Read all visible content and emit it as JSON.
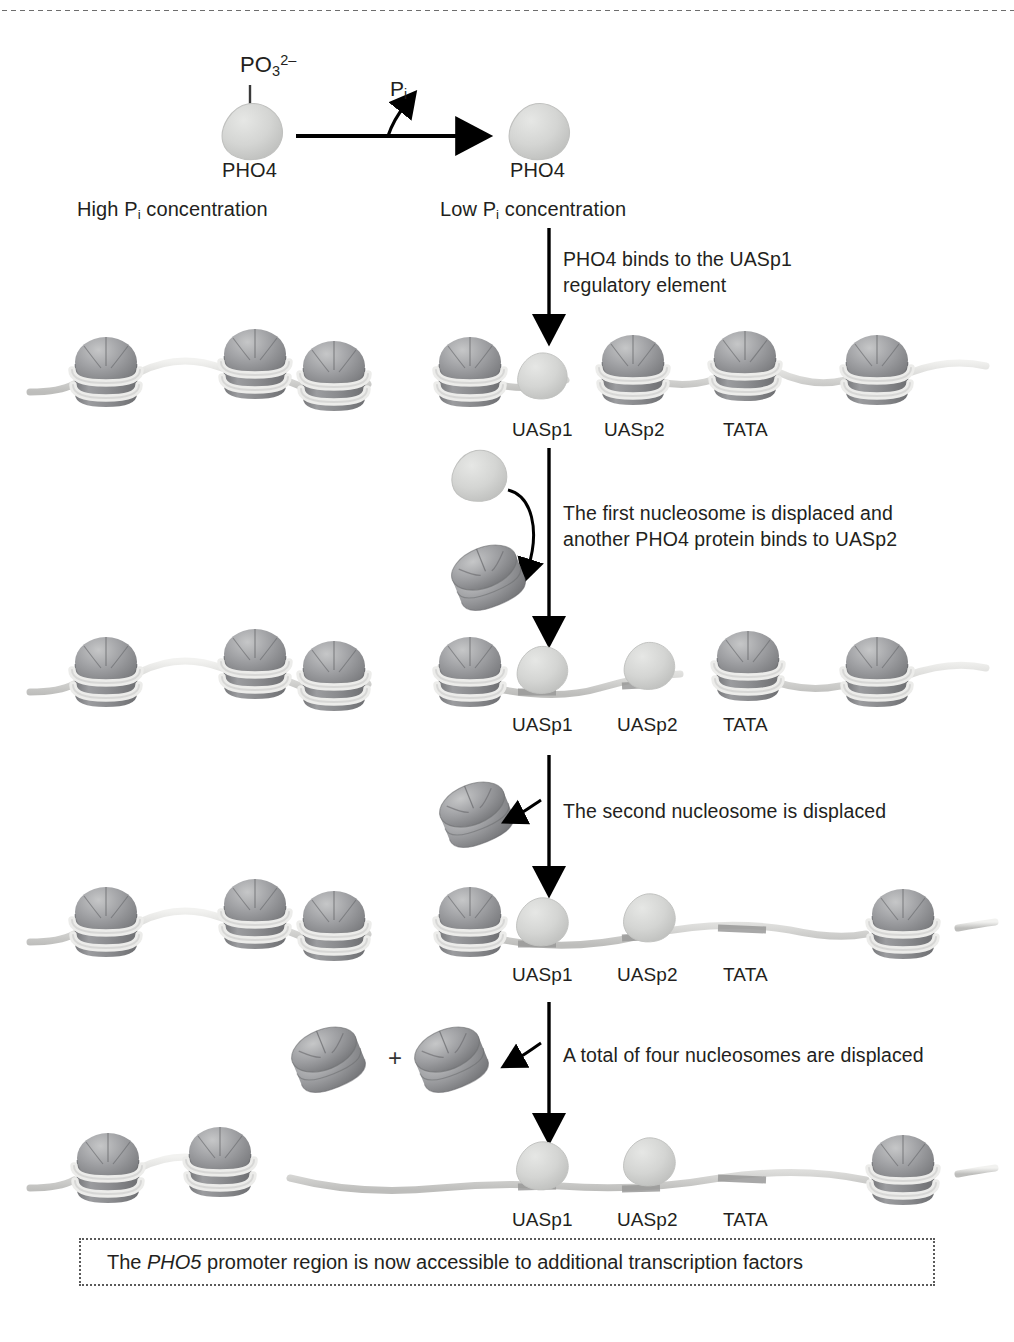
{
  "diagram": {
    "top_rule": "dotted-divider"
  },
  "activation_step": {
    "phosphate_label_main": "PO",
    "phosphate_label_sub": "3",
    "phosphate_label_sup": "2–",
    "released_phosphate_main": "P",
    "released_phosphate_sub": "i",
    "protein_left_label": "PHO4",
    "protein_right_label": "PHO4",
    "condition_left_pre": "High P",
    "condition_left_sub": "i",
    "condition_left_post": " concentration",
    "condition_right_pre": "Low P",
    "condition_right_sub": "i",
    "condition_right_post": " concentration"
  },
  "steps": [
    {
      "id": "step-1",
      "text": "PHO4 binds to the UASp1\nregulatory element",
      "line1": "PHO4 binds to the UASp1",
      "line2": "regulatory element"
    },
    {
      "id": "step-2",
      "text": "The first nucleosome is displaced and\nanother PHO4 protein binds to UASp2",
      "line1": "The first nucleosome is displaced and",
      "line2": "another PHO4 protein binds to UASp2"
    },
    {
      "id": "step-3",
      "text": "The second nucleosome is displaced",
      "line1": "The second nucleosome is displaced",
      "line2": ""
    },
    {
      "id": "step-4",
      "text": "A total of four nucleosomes are displaced",
      "line1": "A total of four nucleosomes are displaced",
      "line2": ""
    }
  ],
  "plus_sign": "+",
  "site_labels": {
    "uasp1": "UASp1",
    "uasp2": "UASp2",
    "tata": "TATA"
  },
  "rows": [
    {
      "id": "chromatin-row-1",
      "nucleosome_count": 7,
      "pho4_bound_count": 1,
      "site_labels": [
        "UASp1",
        "UASp2",
        "TATA"
      ]
    },
    {
      "id": "chromatin-row-2",
      "nucleosome_count": 6,
      "pho4_bound_count": 2,
      "site_labels": [
        "UASp1",
        "UASp2",
        "TATA"
      ]
    },
    {
      "id": "chromatin-row-3",
      "nucleosome_count": 5,
      "pho4_bound_count": 2,
      "site_labels": [
        "UASp1",
        "UASp2",
        "TATA"
      ]
    },
    {
      "id": "chromatin-row-4",
      "nucleosome_count": 3,
      "pho4_bound_count": 2,
      "site_labels": [
        "UASp1",
        "UASp2",
        "TATA"
      ]
    }
  ],
  "caption": {
    "before_italic": "The ",
    "italic": "PHO5",
    "after_italic": " promoter region is now accessible to additional transcription factors"
  },
  "colors": {
    "nucleosome_body": "#8f9093",
    "nucleosome_dome": "#a8a9ab",
    "nucleosome_dark": "#6f7073",
    "dna_strand": "#d8d8d6",
    "dna_site": "#9a9a99",
    "pho4_protein": "#d2d3d1",
    "arrow": "#000000",
    "text": "#231f20",
    "dotted_border": "#5a5a5a"
  }
}
